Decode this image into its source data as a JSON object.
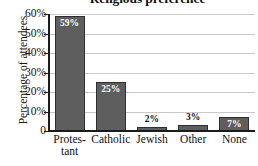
{
  "chart_data": {
    "type": "bar",
    "title": "Religious preference",
    "xlabel": "",
    "ylabel": "Percentage of attendees",
    "categories": [
      "Protes-\ntant",
      "Catholic",
      "Jewish",
      "Other",
      "None"
    ],
    "values": [
      59,
      25,
      2,
      3,
      7
    ],
    "value_labels": [
      "59%",
      "25%",
      "2%",
      "3%",
      "7%"
    ],
    "label_placement": [
      "inside",
      "inside",
      "above",
      "above",
      "inside"
    ],
    "ylim": [
      0,
      60
    ],
    "yticks": [
      60,
      50,
      40,
      30,
      20,
      10,
      0
    ],
    "ytick_labels": [
      "60%",
      "50%",
      "40%",
      "30%",
      "20%",
      "10%",
      "0"
    ],
    "grid": true,
    "grid_axis": "y",
    "legend": false,
    "bar_color": "#5e5e5e",
    "bar_edge_color": "#2f2f2f",
    "inside_label_color": "#ffffff",
    "above_label_color": "#111111",
    "gridline_color": "#c9c9c9",
    "axis_color": "#1b1b1b",
    "background_color": "#ffffff"
  }
}
